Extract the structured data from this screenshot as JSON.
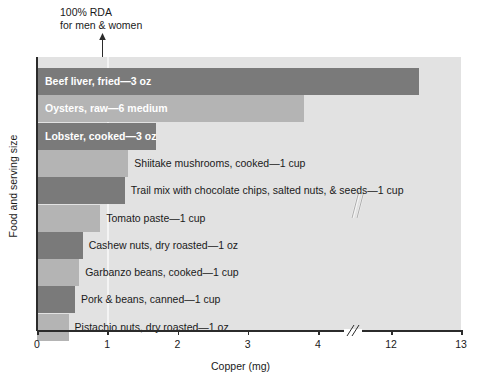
{
  "chart_data": {
    "type": "bar",
    "orientation": "horizontal",
    "title": "",
    "xlabel": "Copper (mg)",
    "ylabel": "Food and serving size",
    "xlim": [
      0,
      13
    ],
    "grid": false,
    "legend": null,
    "axis_break": {
      "from": 4,
      "to": 12,
      "label": "//"
    },
    "xticks": [
      {
        "value": 0,
        "label": "0"
      },
      {
        "value": 1,
        "label": "1"
      },
      {
        "value": 2,
        "label": "2"
      },
      {
        "value": 3,
        "label": "3"
      },
      {
        "value": 4,
        "label": "4"
      },
      {
        "value": 12,
        "label": "12"
      },
      {
        "value": 13,
        "label": "13"
      }
    ],
    "annotation": {
      "text_line1": "100% RDA",
      "text_line2": "for men & women",
      "value": 1.0,
      "icon": "up-arrow-icon"
    },
    "categories": [
      "Beef liver, fried—3 oz",
      "Oysters, raw—6 medium",
      "Lobster, cooked—3 oz",
      "Shiitake mushrooms, cooked—1 cup",
      "Trail mix with chocolate chips, salted nuts, & seeds—1 cup",
      "Tomato paste—1 cup",
      "Cashew nuts, dry roasted—1 oz",
      "Garbanzo beans, cooked—1 cup",
      "Pork & beans, canned—1 cup",
      "Pistachio nuts, dry roasted—1 oz"
    ],
    "values": [
      12.4,
      3.8,
      1.7,
      1.3,
      1.25,
      0.9,
      0.65,
      0.6,
      0.54,
      0.45
    ],
    "bars": [
      {
        "label": "Beef liver, fried—3 oz",
        "value": 12.4,
        "shade": "dark",
        "label_position": "inside",
        "broken": true
      },
      {
        "label": "Oysters, raw—6 medium",
        "value": 3.8,
        "shade": "light",
        "label_position": "inside",
        "broken": false
      },
      {
        "label": "Lobster, cooked—3 oz",
        "value": 1.7,
        "shade": "dark",
        "label_position": "inside",
        "broken": false
      },
      {
        "label": "Shiitake mushrooms, cooked—1 cup",
        "value": 1.3,
        "shade": "light",
        "label_position": "outside",
        "broken": false
      },
      {
        "label": "Trail mix with chocolate chips, salted nuts, & seeds—1 cup",
        "value": 1.25,
        "shade": "dark",
        "label_position": "outside",
        "broken": false
      },
      {
        "label": "Tomato paste—1 cup",
        "value": 0.9,
        "shade": "light",
        "label_position": "outside",
        "broken": false
      },
      {
        "label": "Cashew nuts, dry roasted—1 oz",
        "value": 0.65,
        "shade": "dark",
        "label_position": "outside",
        "broken": false
      },
      {
        "label": "Garbanzo beans, cooked—1 cup",
        "value": 0.6,
        "shade": "light",
        "label_position": "outside",
        "broken": false
      },
      {
        "label": "Pork & beans, canned—1 cup",
        "value": 0.54,
        "shade": "dark",
        "label_position": "outside",
        "broken": false
      },
      {
        "label": "Pistachio nuts, dry roasted—1 oz",
        "value": 0.45,
        "shade": "light",
        "label_position": "outside",
        "broken": false
      }
    ],
    "colors": {
      "plot_background": "#e2e2e2",
      "bar_dark": "#7a7a7a",
      "bar_light": "#b4b4b4",
      "axis": "#2b2b2b",
      "inside_label_text": "#ffffff",
      "outside_label_text": "#1a1a1a",
      "rda_line": "#f4f4f4"
    }
  }
}
